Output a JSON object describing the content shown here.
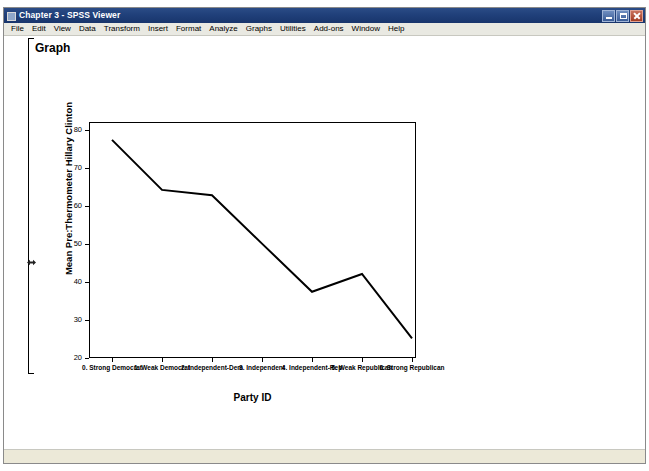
{
  "window": {
    "title": "Chapter 3 - SPSS Viewer",
    "app_icon": "spss-viewer-icon",
    "controls": {
      "minimize_label": "Minimize",
      "maximize_label": "Restore",
      "close_label": "Close"
    }
  },
  "menu": {
    "items": [
      {
        "label": "File"
      },
      {
        "label": "Edit"
      },
      {
        "label": "View"
      },
      {
        "label": "Data"
      },
      {
        "label": "Transform"
      },
      {
        "label": "Insert"
      },
      {
        "label": "Format"
      },
      {
        "label": "Analyze"
      },
      {
        "label": "Graphs"
      },
      {
        "label": "Utilities"
      },
      {
        "label": "Add-ons"
      },
      {
        "label": "Window"
      },
      {
        "label": "Help"
      }
    ]
  },
  "output": {
    "heading": "Graph",
    "status_text": ""
  },
  "chart_data": {
    "type": "line",
    "title": "",
    "xlabel": "Party ID",
    "ylabel": "Mean Pre:Thermometer Hillary Clinton",
    "categories": [
      "0. Strong Democrat",
      "1. Weak Democrat",
      "2. Independent-Dem",
      "3. Independent",
      "4. Independent-Rep",
      "5. Weak Republican",
      "6. Strong Republican"
    ],
    "values": [
      77.0,
      63.0,
      61.5,
      48.0,
      34.5,
      39.5,
      21.5
    ],
    "ylim": [
      16,
      82
    ],
    "yticks": [
      20,
      30,
      40,
      50,
      60,
      70,
      80
    ],
    "ytick_labels": [
      "20",
      "30",
      "40",
      "50",
      "60",
      "70",
      "80"
    ],
    "grid": false,
    "legend": false,
    "line_color": "#000000",
    "line_width": 2
  }
}
